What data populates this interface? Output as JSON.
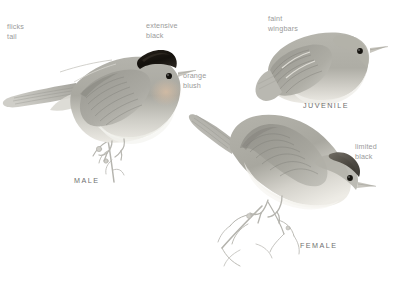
{
  "plate": {
    "background_color": "#ffffff",
    "annotation_color": "#9a9a9a",
    "form_label_color": "#6f6f6f",
    "plumage_colors": {
      "cap_black": "#15130f",
      "upperparts_gray": "#a9a8a1",
      "wing_gray": "#8e8d86",
      "underparts_pale": "#e6e4de",
      "orange_blush": "#d8c3ad",
      "twig_gray": "#b3b2ac",
      "eye_black": "#1a1a18",
      "bill_gray": "#c9c7c0"
    }
  },
  "annotations": [
    {
      "id": "flicks-tail",
      "text": "flicks\ntail"
    },
    {
      "id": "extensive-black",
      "text": "extensive\nblack"
    },
    {
      "id": "orange-blush",
      "text": "orange\nblush"
    },
    {
      "id": "faint-wingbars",
      "text": "faint\nwingbars"
    },
    {
      "id": "limited-black",
      "text": "limited\nblack"
    }
  ],
  "forms": [
    {
      "id": "male",
      "label": "MALE"
    },
    {
      "id": "juvenile",
      "label": "JUVENILE"
    },
    {
      "id": "female",
      "label": "FEMALE"
    }
  ]
}
